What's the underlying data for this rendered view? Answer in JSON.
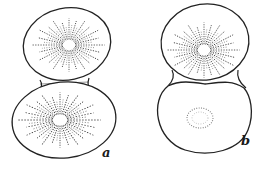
{
  "figure": {
    "panels": [
      {
        "id": "a",
        "label": "a",
        "cells": [
          {
            "position": "top",
            "pattern": "radiating-striations"
          },
          {
            "position": "bottom",
            "pattern": "radiating-striations"
          }
        ]
      },
      {
        "id": "b",
        "label": "b",
        "cells": [
          {
            "position": "top",
            "pattern": "radiating-striations"
          },
          {
            "position": "bottom",
            "pattern": "dotted-center-ring"
          }
        ]
      }
    ],
    "colors": {
      "line": "#222222",
      "background": "#ffffff"
    }
  }
}
